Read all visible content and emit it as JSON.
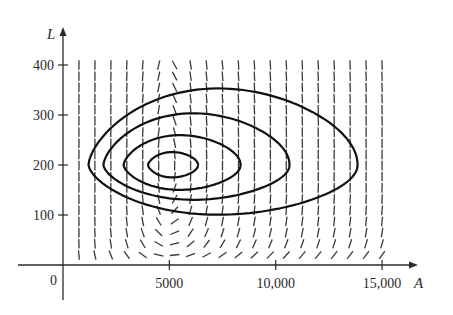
{
  "chart_data": {
    "type": "direction_field_with_trajectories",
    "title": "",
    "xlabel": "A",
    "ylabel": "L",
    "origin_label": "0",
    "x_ticks": [
      {
        "value": 5000,
        "label": "5000"
      },
      {
        "value": 10000,
        "label": "10,000"
      },
      {
        "value": 15000,
        "label": "15,000"
      }
    ],
    "y_ticks": [
      {
        "value": 100,
        "label": "100"
      },
      {
        "value": 200,
        "label": "200"
      },
      {
        "value": 300,
        "label": "300"
      },
      {
        "value": 400,
        "label": "400"
      }
    ],
    "xlim": [
      0,
      15000
    ],
    "ylim": [
      0,
      400
    ],
    "grid": false,
    "legend": null,
    "equilibrium": {
      "A": 5000,
      "L": 200
    },
    "direction_field": {
      "A_range": [
        750,
        15000
      ],
      "L_range": [
        20,
        400
      ],
      "columns": 20,
      "rows": 18,
      "note": "Short dashes showing slope dL/dA of a predator-prey system; vertical along L=200, horizontal along A=5000"
    },
    "trajectories": [
      {
        "name": "orbit-1",
        "A_min": 4000,
        "A_max": 6350,
        "L_min": 175,
        "L_max": 226
      },
      {
        "name": "orbit-2",
        "A_min": 2850,
        "A_max": 8350,
        "L_min": 150,
        "L_max": 260
      },
      {
        "name": "orbit-3",
        "A_min": 1900,
        "A_max": 10650,
        "L_min": 130,
        "L_max": 304
      },
      {
        "name": "orbit-4",
        "A_min": 1200,
        "A_max": 13850,
        "L_min": 100,
        "L_max": 354
      }
    ]
  },
  "plot": {
    "px_origin_x": 63,
    "px_origin_y": 265,
    "px_per_A": 0.02127,
    "px_per_L": 0.5,
    "colors": {
      "ink": "#2a2a2a",
      "field": "#3a3a3a"
    }
  }
}
